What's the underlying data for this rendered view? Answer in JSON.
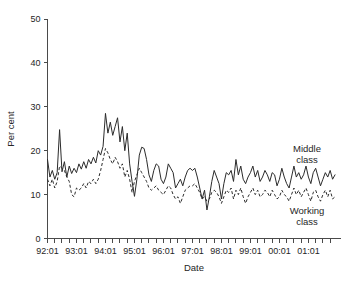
{
  "chart_data": {
    "type": "line",
    "title": "",
    "xlabel": "Date",
    "ylabel": "Per cent",
    "ylim": [
      0,
      50
    ],
    "yticks": [
      0,
      10,
      20,
      30,
      40,
      50
    ],
    "ytick_labels": [
      "0",
      "10",
      "20",
      "30",
      "40",
      "50"
    ],
    "grid": false,
    "legend_position": "inline-annotation",
    "x_start": "92:01",
    "x_end": "01:12",
    "x_tick_interval": "quarterly",
    "xtick_labels": [
      "92:01",
      "93:01",
      "94:01",
      "95:01",
      "96:01",
      "97:01",
      "98:01",
      "99:01",
      "00:01",
      "01:01"
    ],
    "x": [
      "92:01",
      "92:02",
      "92:03",
      "92:04",
      "92:05",
      "92:06",
      "92:07",
      "92:08",
      "92:09",
      "92:10",
      "92:11",
      "92:12",
      "93:01",
      "93:02",
      "93:03",
      "93:04",
      "93:05",
      "93:06",
      "93:07",
      "93:08",
      "93:09",
      "93:10",
      "93:11",
      "93:12",
      "94:01",
      "94:02",
      "94:03",
      "94:04",
      "94:05",
      "94:06",
      "94:07",
      "94:08",
      "94:09",
      "94:10",
      "94:11",
      "94:12",
      "95:01",
      "95:02",
      "95:03",
      "95:04",
      "95:05",
      "95:06",
      "95:07",
      "95:08",
      "95:09",
      "95:10",
      "95:11",
      "95:12",
      "96:01",
      "96:02",
      "96:03",
      "96:04",
      "96:05",
      "96:06",
      "96:07",
      "96:08",
      "96:09",
      "96:10",
      "96:11",
      "96:12",
      "97:01",
      "97:02",
      "97:03",
      "97:04",
      "97:05",
      "97:06",
      "97:07",
      "97:08",
      "97:09",
      "97:10",
      "97:11",
      "97:12",
      "98:01",
      "98:02",
      "98:03",
      "98:04",
      "98:05",
      "98:06",
      "98:07",
      "98:08",
      "98:09",
      "98:10",
      "98:11",
      "98:12",
      "99:01",
      "99:02",
      "99:03",
      "99:04",
      "99:05",
      "99:06",
      "99:07",
      "99:08",
      "99:09",
      "99:10",
      "99:11",
      "99:12",
      "00:01",
      "00:02",
      "00:03",
      "00:04",
      "00:05",
      "00:06",
      "00:07",
      "00:08",
      "00:09",
      "00:10",
      "00:11",
      "00:12",
      "01:01",
      "01:02",
      "01:03",
      "01:04",
      "01:05",
      "01:06",
      "01:07",
      "01:08",
      "01:09",
      "01:10",
      "01:11",
      "01:12"
    ],
    "series": [
      {
        "name": "Middle class",
        "style": "solid",
        "color": "#2b2b2b",
        "values": [
          18.0,
          14.0,
          15.5,
          13.5,
          15.0,
          24.8,
          15.2,
          17.5,
          14.0,
          16.5,
          14.8,
          16.0,
          15.0,
          17.0,
          15.8,
          17.5,
          16.0,
          18.0,
          17.0,
          18.5,
          17.2,
          20.0,
          19.0,
          21.0,
          28.5,
          24.0,
          26.5,
          23.5,
          25.5,
          27.5,
          22.0,
          25.5,
          20.0,
          24.0,
          17.0,
          13.0,
          9.6,
          13.5,
          19.0,
          20.8,
          20.5,
          18.0,
          14.5,
          13.0,
          15.5,
          17.0,
          16.5,
          13.5,
          12.5,
          14.0,
          17.0,
          16.0,
          15.0,
          11.5,
          12.5,
          13.5,
          12.0,
          14.0,
          15.5,
          16.0,
          15.5,
          16.0,
          14.0,
          11.5,
          9.0,
          11.0,
          6.5,
          9.5,
          13.0,
          15.5,
          14.0,
          12.5,
          9.0,
          12.5,
          15.0,
          14.5,
          15.5,
          13.0,
          18.0,
          14.5,
          16.5,
          13.5,
          12.5,
          14.0,
          15.0,
          16.5,
          14.0,
          15.5,
          13.0,
          14.0,
          15.5,
          14.5,
          13.0,
          15.0,
          14.5,
          12.0,
          13.5,
          16.0,
          14.0,
          12.5,
          11.5,
          14.0,
          16.5,
          14.0,
          15.0,
          13.5,
          14.5,
          16.5,
          14.0,
          12.5,
          15.0,
          16.0,
          14.0,
          12.0,
          13.5,
          15.0,
          14.0,
          15.5,
          13.5,
          14.5
        ]
      },
      {
        "name": "Working class",
        "style": "dashed",
        "color": "#2b2b2b",
        "values": [
          13.5,
          12.0,
          13.5,
          11.5,
          13.0,
          16.5,
          16.0,
          15.5,
          14.0,
          13.0,
          10.0,
          9.5,
          11.5,
          11.0,
          11.5,
          12.5,
          11.5,
          13.0,
          12.5,
          13.5,
          12.5,
          13.5,
          15.5,
          18.0,
          20.5,
          19.5,
          18.0,
          17.0,
          18.5,
          17.5,
          16.0,
          17.0,
          14.0,
          15.5,
          13.5,
          10.5,
          13.0,
          14.5,
          16.0,
          15.0,
          14.0,
          13.0,
          11.5,
          11.0,
          11.5,
          12.0,
          11.0,
          10.5,
          10.0,
          11.0,
          12.0,
          11.5,
          10.0,
          9.0,
          9.5,
          8.0,
          9.5,
          11.0,
          11.5,
          12.0,
          12.0,
          12.5,
          11.5,
          10.5,
          9.0,
          9.5,
          8.5,
          9.0,
          10.5,
          11.0,
          10.5,
          9.5,
          8.0,
          9.5,
          11.0,
          10.5,
          11.5,
          9.0,
          11.0,
          10.0,
          11.5,
          9.5,
          8.0,
          9.5,
          10.5,
          11.5,
          10.0,
          11.0,
          9.5,
          10.0,
          11.0,
          10.5,
          9.5,
          11.0,
          10.0,
          9.0,
          9.5,
          11.0,
          10.0,
          9.5,
          8.5,
          10.0,
          11.5,
          10.0,
          11.0,
          9.5,
          10.5,
          11.5,
          10.0,
          8.5,
          10.5,
          11.0,
          9.5,
          8.5,
          10.0,
          11.0,
          9.5,
          11.0,
          9.0,
          9.5
        ]
      }
    ],
    "annotations": [
      {
        "text_line1": "Middle",
        "text_line2": "class",
        "series": "Middle class"
      },
      {
        "text_line1": "Working",
        "text_line2": "class",
        "series": "Working class"
      }
    ]
  },
  "labels": {
    "ylabel": "Per cent",
    "xlabel": "Date",
    "middle_class_line1": "Middle",
    "middle_class_line2": "class",
    "working_class_line1": "Working",
    "working_class_line2": "class"
  }
}
